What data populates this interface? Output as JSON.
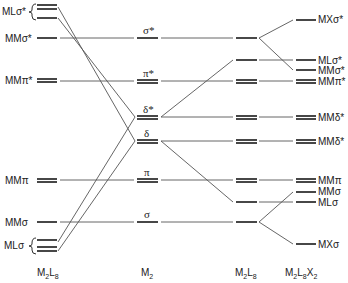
{
  "diagram": {
    "type": "molecular-orbital-energy-level-diagram",
    "columns": [
      {
        "id": "col1",
        "label": "M₂L₈",
        "label_base": "M",
        "label_sub1": "2",
        "label_mid": "L",
        "label_sub2": "8"
      },
      {
        "id": "col2",
        "label": "M₂"
      },
      {
        "id": "col3",
        "label": "M₂L₈",
        "label_base": "M",
        "label_sub1": "2",
        "label_mid": "L",
        "label_sub2": "8"
      },
      {
        "id": "col4",
        "label": "M₂L₈X₂",
        "label_base": "M",
        "label_sub1": "2",
        "label_mid": "L",
        "label_sub2": "8",
        "label_end": "X",
        "label_sub3": "2"
      }
    ],
    "left_labels": {
      "ml_sigma_star": "MLσ*",
      "mm_sigma_star": "MMσ*",
      "mm_pi_star": "MMπ*",
      "mm_pi": "MMπ",
      "mm_sigma": "MMσ",
      "ml_sigma": "MLσ"
    },
    "m2_labels": {
      "sigma_star": "σ*",
      "pi_star": "π*",
      "delta_star": "δ*",
      "delta": "δ",
      "pi": "π",
      "sigma": "σ"
    },
    "right_labels": {
      "mx_sigma_star": "MXσ*",
      "ml_sigma_star": "MLσ*",
      "mm_sigma_star": "MMσ*",
      "mm_pi_star": "MMπ*",
      "mm_delta_star_1": "MMδ*",
      "mm_delta_star_2": "MMδ*",
      "mm_pi": "MMπ",
      "mm_sigma": "MMσ",
      "ml_sigma": "MLσ",
      "mx_sigma": "MXσ"
    }
  }
}
